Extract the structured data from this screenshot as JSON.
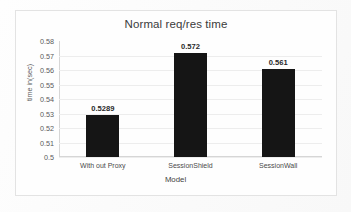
{
  "chart_data": {
    "type": "bar",
    "title": "Normal req/res time",
    "xlabel": "Model",
    "ylabel": "time in(sec)",
    "categories": [
      "With out Proxy",
      "SessionShield",
      "SessionWall"
    ],
    "values": [
      0.5289,
      0.572,
      0.561
    ],
    "data_labels": [
      "0.5289",
      "0.572",
      "0.561"
    ],
    "ylim": [
      0.5,
      0.58
    ],
    "ytick_step": 0.01,
    "ytick_labels": [
      "0.58",
      "0.57",
      "0.56",
      "0.55",
      "0.54",
      "0.53",
      "0.52",
      "0.51",
      "0.5"
    ],
    "ytick_values": [
      0.58,
      0.57,
      0.56,
      0.55,
      0.54,
      0.53,
      0.52,
      0.51,
      0.5
    ],
    "grid": true,
    "legend": false,
    "bar_color": "#151515",
    "grid_color": "#ededed",
    "axis_color": "#d6d6d6",
    "plot_background": "#fefefe"
  }
}
